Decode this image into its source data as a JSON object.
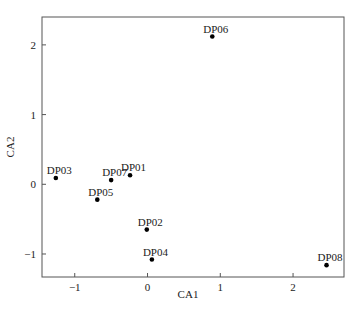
{
  "chart_data": {
    "type": "scatter",
    "title": "",
    "xlabel": "CA1",
    "ylabel": "CA2",
    "xlim": [
      -1.45,
      2.7
    ],
    "ylim": [
      -1.33,
      2.4
    ],
    "xticks": [
      -1,
      0,
      1,
      2
    ],
    "yticks": [
      -1,
      0,
      1,
      2
    ],
    "xtick_labels": [
      "−1",
      "0",
      "1",
      "2"
    ],
    "ytick_labels": [
      "−1",
      "0",
      "1",
      "2"
    ],
    "grid": false,
    "legend": null,
    "points": [
      {
        "label": "DP01",
        "x": -0.24,
        "y": 0.13
      },
      {
        "label": "DP02",
        "x": -0.01,
        "y": -0.65
      },
      {
        "label": "DP03",
        "x": -1.26,
        "y": 0.09
      },
      {
        "label": "DP04",
        "x": 0.06,
        "y": -1.08
      },
      {
        "label": "DP05",
        "x": -0.69,
        "y": -0.22
      },
      {
        "label": "DP06",
        "x": 0.89,
        "y": 2.12
      },
      {
        "label": "DP07",
        "x": -0.5,
        "y": 0.06
      },
      {
        "label": "DP08",
        "x": 2.46,
        "y": -1.16
      }
    ]
  },
  "colors": {
    "frame": "#555555",
    "marker": "#000000",
    "text": "#222222"
  }
}
